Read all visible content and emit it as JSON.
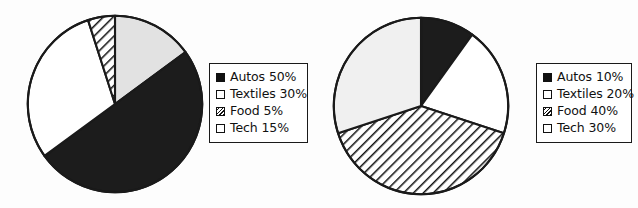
{
  "chart_data": [
    {
      "type": "pie",
      "title": "",
      "legend_position": "right",
      "start_angle": 0,
      "direction": "clockwise",
      "categories": [
        "Autos",
        "Textiles",
        "Food",
        "Tech"
      ],
      "values": [
        50,
        30,
        5,
        15
      ],
      "unit": "%",
      "legend": [
        {
          "label": "Autos 50%",
          "name": "Autos",
          "value": 50,
          "swatch": "solid"
        },
        {
          "label": "Textiles 30%",
          "name": "Textiles",
          "value": 30,
          "swatch": "white"
        },
        {
          "label": "Food 5%",
          "name": "Food",
          "value": 5,
          "swatch": "hatch"
        },
        {
          "label": "Tech 15%",
          "name": "Tech",
          "value": 15,
          "swatch": "light"
        }
      ],
      "slices": [
        {
          "name": "Tech",
          "value": 15,
          "fill": "#e2e2e2",
          "order": 1
        },
        {
          "name": "Autos",
          "value": 50,
          "fill": "#1c1c1c",
          "order": 2
        },
        {
          "name": "Textiles",
          "value": 30,
          "fill": "#ffffff",
          "order": 3
        },
        {
          "name": "Food",
          "value": 5,
          "fill": "hatch",
          "order": 4
        }
      ]
    },
    {
      "type": "pie",
      "title": "",
      "legend_position": "right",
      "start_angle": 0,
      "direction": "clockwise",
      "categories": [
        "Autos",
        "Textiles",
        "Food",
        "Tech"
      ],
      "values": [
        10,
        20,
        40,
        30
      ],
      "unit": "%",
      "legend": [
        {
          "label": "Autos 10%",
          "name": "Autos",
          "value": 10,
          "swatch": "solid"
        },
        {
          "label": "Textiles 20%",
          "name": "Textiles",
          "value": 20,
          "swatch": "white"
        },
        {
          "label": "Food 40%",
          "name": "Food",
          "value": 40,
          "swatch": "hatch"
        },
        {
          "label": "Tech 30%",
          "name": "Tech",
          "value": 30,
          "swatch": "light"
        }
      ],
      "slices": [
        {
          "name": "Autos",
          "value": 10,
          "fill": "#1c1c1c",
          "order": 1
        },
        {
          "name": "Textiles",
          "value": 20,
          "fill": "#ffffff",
          "order": 2
        },
        {
          "name": "Food",
          "value": 40,
          "fill": "hatch",
          "order": 3
        },
        {
          "name": "Tech",
          "value": 30,
          "fill": "#f0f0f0",
          "order": 4
        }
      ]
    }
  ],
  "colors": {
    "outline": "#1a1a1a",
    "solid": "#1c1c1c",
    "light": "#e6e6e6",
    "white": "#ffffff",
    "background": "#fdfdfd"
  }
}
